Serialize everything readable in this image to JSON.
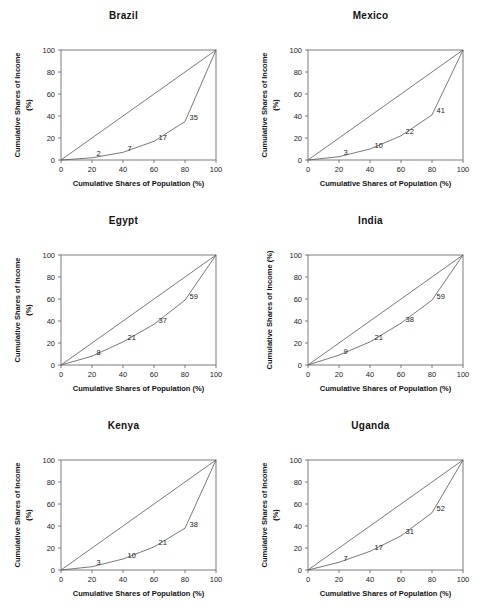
{
  "figure": {
    "footnote": "",
    "panel_count": 6
  },
  "axes": {
    "xlabel": "Cumulative Shares of Population (%)",
    "ylabel_line1": "Cumulative Shares of Income",
    "ylabel_line2": "(%)",
    "ylabel_single": "Cumulative Shares of Income (%)",
    "xticks": [
      "0",
      "20",
      "40",
      "60",
      "80",
      "100"
    ],
    "yticks": [
      "0",
      "20",
      "40",
      "60",
      "80",
      "100"
    ]
  },
  "chart_data": [
    {
      "type": "line",
      "title": "Brazil",
      "xlabel": "Cumulative Shares of Population (%)",
      "ylabel": "Cumulative Shares of Income (%)",
      "xlim": [
        0,
        100
      ],
      "ylim": [
        0,
        100
      ],
      "grid": false,
      "legend": "none",
      "ylabel_wrapped": true,
      "series": [
        {
          "name": "Line of equality",
          "x": [
            0,
            100
          ],
          "values": [
            0,
            100
          ]
        },
        {
          "name": "Lorenz curve",
          "x": [
            0,
            20,
            40,
            60,
            80,
            100
          ],
          "values": [
            0,
            2,
            7,
            17,
            35,
            100
          ]
        }
      ],
      "point_labels": [
        "2",
        "7",
        "17",
        "35"
      ]
    },
    {
      "type": "line",
      "title": "Mexico",
      "xlabel": "Cumulative Shares of Population (%)",
      "ylabel": "Cumulative Shares of Income (%)",
      "xlim": [
        0,
        100
      ],
      "ylim": [
        0,
        100
      ],
      "grid": false,
      "legend": "none",
      "ylabel_wrapped": true,
      "series": [
        {
          "name": "Line of equality",
          "x": [
            0,
            100
          ],
          "values": [
            0,
            100
          ]
        },
        {
          "name": "Lorenz curve",
          "x": [
            0,
            20,
            40,
            60,
            80,
            100
          ],
          "values": [
            0,
            3,
            10,
            22,
            41,
            100
          ]
        }
      ],
      "point_labels": [
        "3",
        "10",
        "22",
        "41"
      ]
    },
    {
      "type": "line",
      "title": "Egypt",
      "xlabel": "Cumulative Shares of Population (%)",
      "ylabel": "Cumulative Shares of Income (%)",
      "xlim": [
        0,
        100
      ],
      "ylim": [
        0,
        100
      ],
      "grid": false,
      "legend": "none",
      "ylabel_wrapped": true,
      "series": [
        {
          "name": "Line of equality",
          "x": [
            0,
            100
          ],
          "values": [
            0,
            100
          ]
        },
        {
          "name": "Lorenz curve",
          "x": [
            0,
            20,
            40,
            60,
            80,
            100
          ],
          "values": [
            0,
            8,
            21,
            37,
            59,
            100
          ]
        }
      ],
      "point_labels": [
        "8",
        "21",
        "37",
        "59"
      ]
    },
    {
      "type": "line",
      "title": "India",
      "xlabel": "Cumulative Shares of Population (%)",
      "ylabel": "Cumulative Shares of Income (%)",
      "xlim": [
        0,
        100
      ],
      "ylim": [
        0,
        100
      ],
      "grid": false,
      "legend": "none",
      "ylabel_wrapped": false,
      "series": [
        {
          "name": "Line of equality",
          "x": [
            0,
            100
          ],
          "values": [
            0,
            100
          ]
        },
        {
          "name": "Lorenz curve",
          "x": [
            0,
            20,
            40,
            60,
            80,
            100
          ],
          "values": [
            0,
            9,
            21,
            38,
            59,
            100
          ]
        }
      ],
      "point_labels": [
        "9",
        "21",
        "38",
        "59"
      ]
    },
    {
      "type": "line",
      "title": "Kenya",
      "xlabel": "Cumulative Shares of Population (%)",
      "ylabel": "Cumulative Shares of Income (%)",
      "xlim": [
        0,
        100
      ],
      "ylim": [
        0,
        100
      ],
      "grid": false,
      "legend": "none",
      "ylabel_wrapped": true,
      "series": [
        {
          "name": "Line of equality",
          "x": [
            0,
            100
          ],
          "values": [
            0,
            100
          ]
        },
        {
          "name": "Lorenz curve",
          "x": [
            0,
            20,
            40,
            60,
            80,
            100
          ],
          "values": [
            0,
            3,
            10,
            21,
            38,
            100
          ]
        }
      ],
      "point_labels": [
        "3",
        "10",
        "21",
        "38"
      ]
    },
    {
      "type": "line",
      "title": "Uganda",
      "xlabel": "Cumulative Shares of Population (%)",
      "ylabel": "Cumulative Shares of Income (%)",
      "xlim": [
        0,
        100
      ],
      "ylim": [
        0,
        100
      ],
      "grid": false,
      "legend": "none",
      "ylabel_wrapped": true,
      "series": [
        {
          "name": "Line of equality",
          "x": [
            0,
            100
          ],
          "values": [
            0,
            100
          ]
        },
        {
          "name": "Lorenz curve",
          "x": [
            0,
            20,
            40,
            60,
            80,
            100
          ],
          "values": [
            0,
            7,
            17,
            31,
            52,
            100
          ]
        }
      ],
      "point_labels": [
        "7",
        "17",
        "31",
        "52"
      ]
    }
  ],
  "colors": {
    "line": "#555555",
    "frame": "#6e6e6e",
    "text": "#1a1a1a",
    "background": "#ffffff"
  }
}
